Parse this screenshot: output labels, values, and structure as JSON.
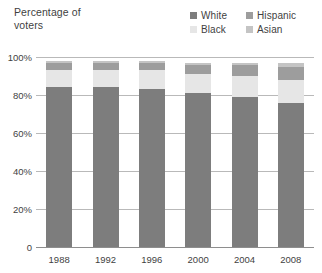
{
  "title": "Percentage of\nvoters",
  "legend": {
    "position": "top-right",
    "entries": [
      {
        "label": "White",
        "color": "#7d7d7d"
      },
      {
        "label": "Hispanic",
        "color": "#9d9d9d"
      },
      {
        "label": "Black",
        "color": "#e6e6e6"
      },
      {
        "label": "Asian",
        "color": "#c4c4c4"
      }
    ]
  },
  "axis": {
    "y_ticks": [
      "100%",
      "80%",
      "60%",
      "40%",
      "20%",
      "0"
    ],
    "x_ticks": [
      "1988",
      "1992",
      "1996",
      "2000",
      "2004",
      "2008"
    ]
  },
  "chart_data": {
    "type": "bar",
    "stacked": true,
    "title": "Percentage of voters",
    "xlabel": "",
    "ylabel": "Percentage of voters",
    "ylim": [
      0,
      100
    ],
    "ytick_values": [
      0,
      20,
      40,
      60,
      80,
      100
    ],
    "ytick_labels": [
      "0",
      "20%",
      "40%",
      "60%",
      "80%",
      "100%"
    ],
    "grid": true,
    "legend_position": "top-right",
    "categories": [
      "1988",
      "1992",
      "1996",
      "2000",
      "2004",
      "2008"
    ],
    "series": [
      {
        "name": "White",
        "color": "#7d7d7d",
        "values": [
          84,
          84,
          83,
          81,
          79,
          76
        ]
      },
      {
        "name": "Black",
        "color": "#e6e6e6",
        "values": [
          9,
          9,
          10,
          10,
          11,
          12
        ]
      },
      {
        "name": "Hispanic",
        "color": "#9d9d9d",
        "values": [
          4,
          4,
          4,
          5,
          6,
          7
        ]
      },
      {
        "name": "Asian",
        "color": "#c4c4c4",
        "values": [
          1,
          1,
          1,
          1,
          1,
          2
        ]
      }
    ],
    "stack_order_bottom_to_top": [
      "White",
      "Black",
      "Hispanic",
      "Asian"
    ]
  }
}
